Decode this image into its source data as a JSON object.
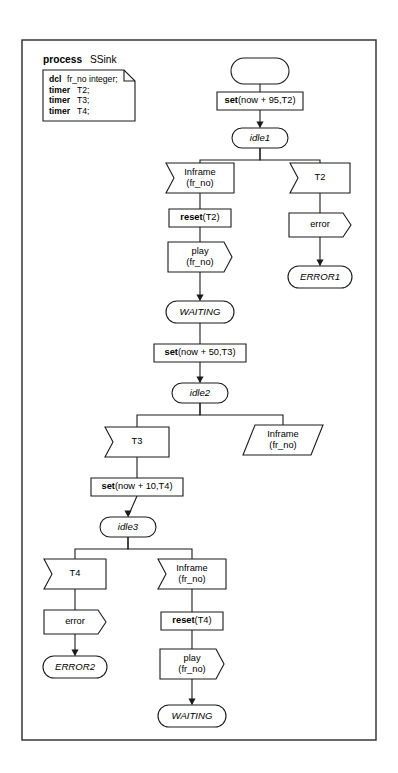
{
  "diagram": {
    "kind": "sdl-process-diagram",
    "frame": {
      "x": 22,
      "y": 40,
      "width": 354,
      "height": 700
    },
    "header": {
      "keyword": "process",
      "name": "SSink",
      "x": 43,
      "y": 63
    },
    "declaration": {
      "x": 43,
      "y": 70,
      "width": 92,
      "height": 51,
      "fold": 11,
      "lines": [
        {
          "bold": "dcl",
          "rest": "fr_no integer;"
        },
        {
          "bold": "timer",
          "rest": "T2;"
        },
        {
          "bold": "timer",
          "rest": "T3;"
        },
        {
          "bold": "timer",
          "rest": "T4;"
        }
      ]
    },
    "nodes": [
      {
        "id": "start",
        "type": "start",
        "label": "",
        "cx": 260,
        "cy": 71,
        "w": 58,
        "h": 26
      },
      {
        "id": "task-set95",
        "type": "task",
        "label": "set(now + 95,T2)",
        "bold_prefix": "set",
        "cx": 260,
        "cy": 101,
        "w": 86,
        "h": 18
      },
      {
        "id": "state-idle1",
        "type": "state",
        "label": "idle1",
        "cx": 260,
        "cy": 138,
        "w": 56,
        "h": 20
      },
      {
        "id": "in-inframe1",
        "type": "input",
        "label": "Inframe\n(fr_no)",
        "cx": 200,
        "cy": 178,
        "w": 68,
        "h": 30
      },
      {
        "id": "in-t2",
        "type": "input",
        "label": "T2",
        "cx": 320,
        "cy": 178,
        "w": 60,
        "h": 30
      },
      {
        "id": "task-reset2",
        "type": "task",
        "label": "reset(T2)",
        "bold_prefix": "reset",
        "cx": 200,
        "cy": 218,
        "w": 62,
        "h": 18
      },
      {
        "id": "out-error1",
        "type": "output",
        "label": "error",
        "cx": 320,
        "cy": 225,
        "w": 62,
        "h": 24
      },
      {
        "id": "out-play1",
        "type": "output",
        "label": "play\n(fr_no)",
        "cx": 200,
        "cy": 257,
        "w": 64,
        "h": 30
      },
      {
        "id": "state-err1",
        "type": "state",
        "label": "ERROR1",
        "cx": 320,
        "cy": 277,
        "w": 64,
        "h": 22
      },
      {
        "id": "state-wait1",
        "type": "state",
        "label": "WAITING",
        "cx": 200,
        "cy": 312,
        "w": 68,
        "h": 22
      },
      {
        "id": "task-set50",
        "type": "task",
        "label": "set(now + 50,T3)",
        "bold_prefix": "set",
        "cx": 200,
        "cy": 353,
        "w": 92,
        "h": 18
      },
      {
        "id": "state-idle2",
        "type": "state",
        "label": "idle2",
        "cx": 200,
        "cy": 393,
        "w": 56,
        "h": 20
      },
      {
        "id": "in-t3",
        "type": "input",
        "label": "T3",
        "cx": 137,
        "cy": 442,
        "w": 64,
        "h": 30
      },
      {
        "id": "save-inframe",
        "type": "save",
        "label": "Inframe\n(fr_no)",
        "cx": 283,
        "cy": 440,
        "w": 80,
        "h": 30
      },
      {
        "id": "task-set10",
        "type": "task",
        "label": "set(now + 10,T4)",
        "bold_prefix": "set",
        "cx": 137,
        "cy": 487,
        "w": 92,
        "h": 18
      },
      {
        "id": "state-idle3",
        "type": "state",
        "label": "idle3",
        "cx": 128,
        "cy": 527,
        "w": 56,
        "h": 20
      },
      {
        "id": "in-t4",
        "type": "input",
        "label": "T4",
        "cx": 75,
        "cy": 574,
        "w": 62,
        "h": 30
      },
      {
        "id": "in-inframe2",
        "type": "input",
        "label": "Inframe\n(fr_no)",
        "cx": 192,
        "cy": 574,
        "w": 68,
        "h": 30
      },
      {
        "id": "out-error2",
        "type": "output",
        "label": "error",
        "cx": 75,
        "cy": 622,
        "w": 62,
        "h": 24
      },
      {
        "id": "task-reset4",
        "type": "task",
        "label": "reset(T4)",
        "bold_prefix": "reset",
        "cx": 192,
        "cy": 621,
        "w": 62,
        "h": 18
      },
      {
        "id": "state-err2",
        "type": "state",
        "label": "ERROR2",
        "cx": 75,
        "cy": 667,
        "w": 64,
        "h": 22
      },
      {
        "id": "out-play2",
        "type": "output",
        "label": "play\n(fr_no)",
        "cx": 192,
        "cy": 664,
        "w": 64,
        "h": 30
      },
      {
        "id": "state-wait2",
        "type": "state",
        "label": "WAITING",
        "cx": 192,
        "cy": 716,
        "w": 68,
        "h": 22
      }
    ],
    "edges": [
      {
        "from": "start",
        "to": "task-set95",
        "arrow": false
      },
      {
        "from": "task-set95",
        "to": "state-idle1",
        "arrow": true
      },
      {
        "from": "state-idle1",
        "to": "in-inframe1",
        "arrow": false,
        "branch": true
      },
      {
        "from": "state-idle1",
        "to": "in-t2",
        "arrow": false,
        "branch": true
      },
      {
        "from": "in-inframe1",
        "to": "task-reset2",
        "arrow": false
      },
      {
        "from": "in-t2",
        "to": "out-error1",
        "arrow": false
      },
      {
        "from": "task-reset2",
        "to": "out-play1",
        "arrow": false
      },
      {
        "from": "out-error1",
        "to": "state-err1",
        "arrow": true
      },
      {
        "from": "out-play1",
        "to": "state-wait1",
        "arrow": true
      },
      {
        "from": "state-wait1",
        "to": "task-set50",
        "arrow": false
      },
      {
        "from": "task-set50",
        "to": "state-idle2",
        "arrow": true
      },
      {
        "from": "state-idle2",
        "to": "in-t3",
        "arrow": false,
        "branch": true
      },
      {
        "from": "state-idle2",
        "to": "save-inframe",
        "arrow": false,
        "branch": true
      },
      {
        "from": "in-t3",
        "to": "task-set10",
        "arrow": false
      },
      {
        "from": "task-set10",
        "to": "state-idle3",
        "arrow": true
      },
      {
        "from": "state-idle3",
        "to": "in-t4",
        "arrow": false,
        "branch": true
      },
      {
        "from": "state-idle3",
        "to": "in-inframe2",
        "arrow": false,
        "branch": true
      },
      {
        "from": "in-t4",
        "to": "out-error2",
        "arrow": false
      },
      {
        "from": "in-inframe2",
        "to": "task-reset4",
        "arrow": false
      },
      {
        "from": "out-error2",
        "to": "state-err2",
        "arrow": true
      },
      {
        "from": "task-reset4",
        "to": "out-play2",
        "arrow": false
      },
      {
        "from": "out-play2",
        "to": "state-wait2",
        "arrow": true
      }
    ],
    "colors": {
      "stroke": "#1a1a1a",
      "fill": "#ffffff",
      "frame": "#2a2a2a",
      "background": "#ffffff"
    }
  }
}
